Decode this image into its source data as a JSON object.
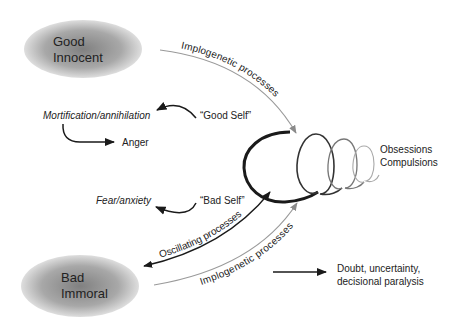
{
  "nodes": {
    "good": {
      "line1": "Good",
      "line2": "Innocent"
    },
    "bad": {
      "line1": "Bad",
      "line2": "Immoral"
    }
  },
  "labels": {
    "implogenetic_top": "Implogenetic processes",
    "implogenetic_bottom": "Implogenetic processes",
    "oscillating": "Oscillating processes",
    "good_self": "“Good Self”",
    "bad_self": "“Bad Self”",
    "mortification": "Mortification/annihilation",
    "anger": "Anger",
    "fear": "Fear/anxiety",
    "obsessions": "Obsessions",
    "compulsions": "Compulsions",
    "doubt_line1": "Doubt, uncertainty,",
    "doubt_line2": "decisional paralysis"
  },
  "colors": {
    "ellipse_center": "#8a8a8a",
    "ellipse_edge": "#d6d6d6",
    "dark_line": "#1a1a1a",
    "gray_line": "#9a9a9a",
    "text": "#222222"
  }
}
